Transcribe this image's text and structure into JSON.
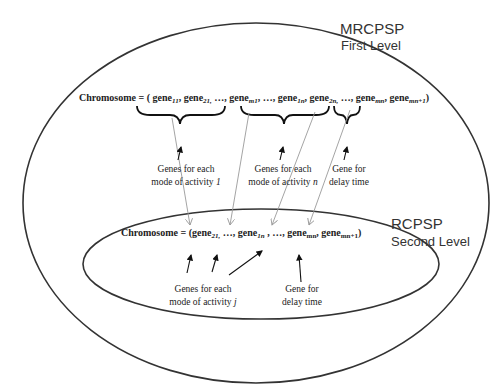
{
  "outer_level": {
    "title": "MRCPSP",
    "subtitle": "First Level"
  },
  "inner_level": {
    "title": "RCPSP",
    "subtitle": "Second Level"
  },
  "first_chromosome": {
    "prefix": "Chromosome = ( ",
    "genes": [
      {
        "base": "gene",
        "sub": "11",
        "sep": ", "
      },
      {
        "base": "gene",
        "sub": "21,",
        "sep": " …, "
      },
      {
        "base": "gene",
        "sub": "m1",
        "sep": ", …, "
      },
      {
        "base": "gene",
        "sub": "1n",
        "sep": ", "
      },
      {
        "base": "gene",
        "sub": "2n,",
        "sep": " …, "
      },
      {
        "base": "gene",
        "sub": "mn",
        "sep": ", "
      },
      {
        "base": "gene",
        "sub": "mn+1",
        "sep": ")"
      }
    ],
    "labels": {
      "activity1": [
        "Genes for each",
        "mode of activity ",
        "1"
      ],
      "activityn": [
        "Genes for each",
        "mode of activity ",
        "n"
      ],
      "delay": [
        "Gene for",
        "delay time"
      ]
    }
  },
  "second_chromosome": {
    "prefix": "Chromosome = (",
    "genes": [
      {
        "base": "gene",
        "sub": "21,",
        "sep": " …, "
      },
      {
        "base": "gene",
        "sub": "1n",
        "sep": " , …, "
      },
      {
        "base": "gene",
        "sub": "mn",
        "sep": ", "
      },
      {
        "base": "gene",
        "sub": "mn+1",
        "sep": ")"
      }
    ],
    "labels": {
      "activityj": [
        "Genes for each",
        "mode of activity ",
        "j"
      ],
      "delay": [
        "Gene for",
        "delay time"
      ]
    }
  },
  "colors": {
    "ellipse_stroke": "#333333",
    "connector_gray": "#9a9a9a",
    "arrow_black": "#111111",
    "text": "#222222"
  }
}
